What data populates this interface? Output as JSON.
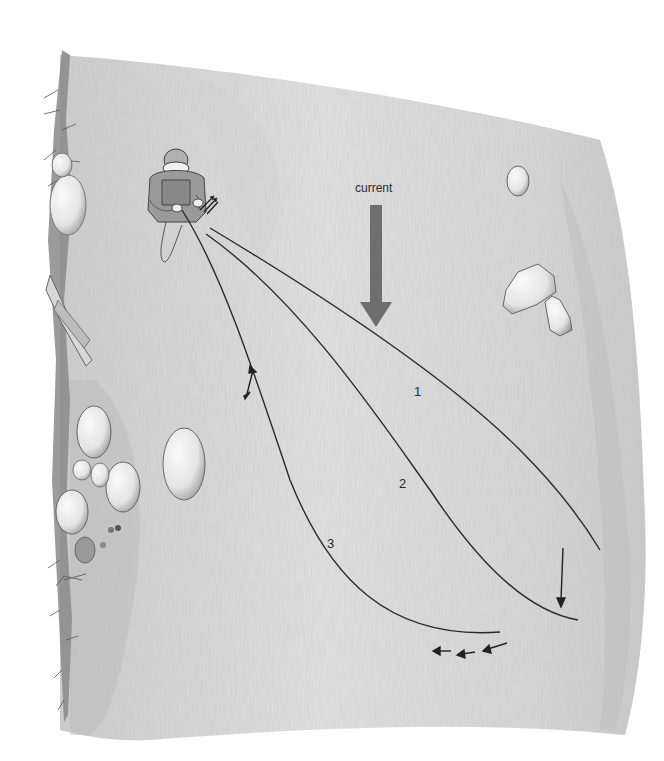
{
  "illustration": {
    "subject": "Angler wading in a river casting three line positions across the current",
    "current_label": "current",
    "line_labels": [
      "1",
      "2",
      "3"
    ],
    "colors": {
      "background": "#ffffff",
      "water_light": "#e6e6e6",
      "water_mid": "#cfcfcf",
      "water_dark": "#b5b5b5",
      "current_arrow": "#6e6e6e",
      "line_stroke": "#2a2a2a",
      "rock_fill": "#f2f2f2",
      "rock_shadow": "#9a9a9a",
      "bank": "#7a7a7a"
    },
    "elements": {
      "angler": "angler-figure",
      "current_arrow": "down-arrow-icon",
      "line_1": "fly-line-1",
      "line_2": "fly-line-2",
      "line_3": "fly-line-3",
      "mend_arrow": "upstream-mend-arrow-icon",
      "drift_arrow": "downstream-drift-arrow-icon",
      "retrieve_arrows": "retrieve-arrows-icon",
      "rocks": [
        "rock-upper-right-small",
        "rock-right-large",
        "rock-right-small",
        "rock-mid-left",
        "rock-cluster-bank"
      ],
      "bank": "left-riverbank"
    }
  }
}
